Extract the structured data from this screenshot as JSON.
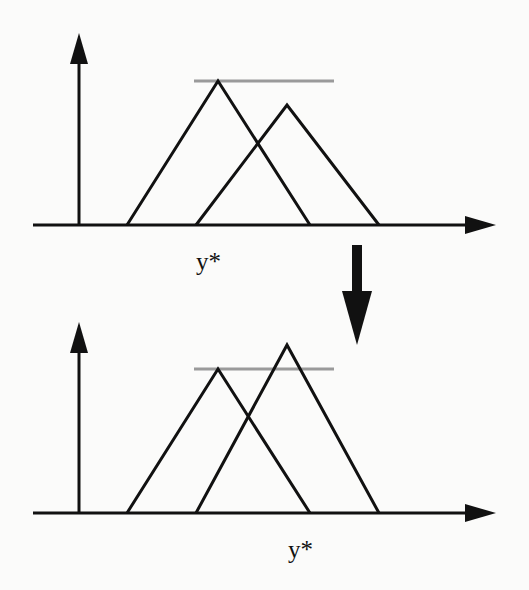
{
  "diagram": {
    "colors": {
      "stroke": "#111111",
      "level_line": "#9a9a9a",
      "background": "#fbfbfa"
    },
    "top_panel": {
      "label": "y*",
      "description": "Two triangular membership functions; left one is higher, grey horizontal max-level line at its peak; y* at left peak"
    },
    "transition_arrow": "down-arrow",
    "bottom_panel": {
      "label": "y*",
      "description": "Right triangular membership function now exceeds grey level line; y* shifted to right peak"
    }
  }
}
